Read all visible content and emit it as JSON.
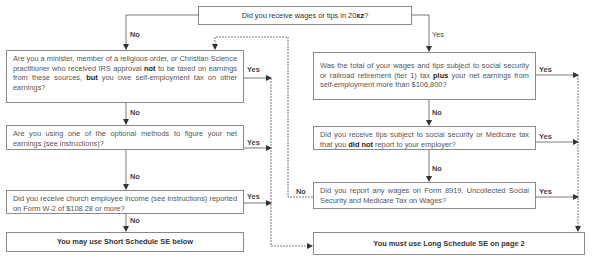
{
  "flowchart": {
    "start": {
      "prefix": "Did you receive wages or tips in 20",
      "year_bold": "xz",
      "suffix": "?"
    },
    "left_column": [
      {
        "id": "minister",
        "parts": [
          {
            "t": "Are you a minister, member of a religious order, or Christian Science practitioner who received IRS approval ",
            "b": false
          },
          {
            "t": "not",
            "b": true
          },
          {
            "t": " to be taxed on earnings from these sources, ",
            "b": false
          },
          {
            "t": "but",
            "b": true
          },
          {
            "t": " you owe self-employment tax on other earnings?",
            "b": false
          }
        ],
        "yes_label": "Yes",
        "no_label": "No"
      },
      {
        "id": "optional-methods",
        "parts": [
          {
            "t": "Are you using one of the optional methods to figure your net earnings (see instructions)?",
            "b": false
          }
        ],
        "yes_label": "Yes",
        "no_label": "No"
      },
      {
        "id": "church-income",
        "parts": [
          {
            "t": "Did you receive church employee income (see instructions) reported on Form W-2 of $108.28 or more?",
            "b": false
          }
        ],
        "yes_label": "Yes",
        "no_label": "No"
      }
    ],
    "right_column": [
      {
        "id": "wages-total",
        "parts": [
          {
            "t": "Was the total of your wages and tips subject to social security or railroad retirement (tier 1) tax ",
            "b": false
          },
          {
            "t": "plus",
            "b": true
          },
          {
            "t": " your net earnings from self-employment more than $106,800?",
            "b": false
          }
        ],
        "yes_label": "Yes",
        "no_label": "No"
      },
      {
        "id": "unreported-tips",
        "parts": [
          {
            "t": "Did you receive tips subject to social security or Medicare tax that you ",
            "b": false
          },
          {
            "t": "did not",
            "b": true
          },
          {
            "t": " report to your employer?",
            "b": false
          }
        ],
        "yes_label": "Yes",
        "no_label": "No"
      },
      {
        "id": "form-8919",
        "parts": [
          {
            "t": "Did you report any wages on Form 8919, Uncollected Social Security and Medicare Tax on Wages?",
            "b": false
          }
        ],
        "yes_label": "Yes",
        "no_label": "No"
      }
    ],
    "start_no_label": "No",
    "start_yes_label": "Yes",
    "outcome_short": "You may use Short Schedule SE below",
    "outcome_long": "You must use Long Schedule SE on page 2"
  },
  "colors": {
    "line": "#6a6a6a",
    "box_border": "#8a8a8a",
    "text": "#555555"
  }
}
